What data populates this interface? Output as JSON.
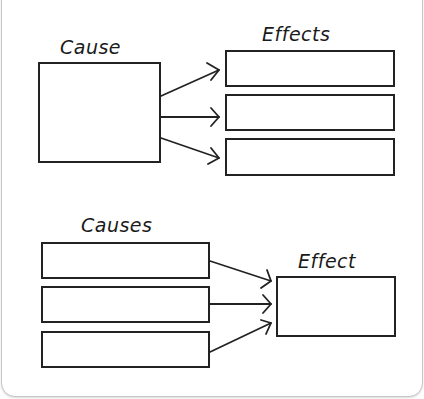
{
  "diagram": {
    "top_section": {
      "cause_label": "Cause",
      "effects_label": "Effects",
      "cause_box_count": 1,
      "effect_box_count": 3
    },
    "bottom_section": {
      "causes_label": "Causes",
      "effect_label": "Effect",
      "cause_box_count": 3,
      "effect_box_count": 1
    },
    "colors": {
      "stroke": "#222222",
      "background": "#ffffff",
      "frame_border": "#c8c8c8"
    }
  }
}
